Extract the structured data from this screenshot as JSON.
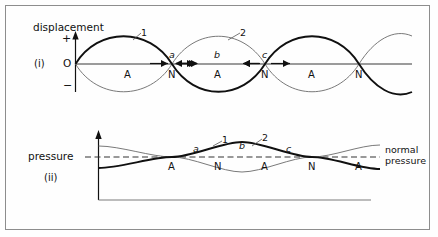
{
  "figure": {
    "title_top_axis_label": "displacement",
    "plus_sign": "+",
    "minus_sign": "−",
    "origin_label": "O",
    "panel_i_label": "(i)",
    "panel_ii_label": "(ii)",
    "pressure_axis_label": "pressure",
    "normal_pressure_label": "normal\npressure",
    "normal_pressure_line1": "normal",
    "normal_pressure_line2": "pressure",
    "curve_label_1": "1",
    "curve_label_2": "2",
    "point_a": "a",
    "point_b": "b",
    "point_c": "c",
    "node_label": "N",
    "antinode_label": "A"
  },
  "panel_i": {
    "name": "displacement-standing-wave",
    "markers": [
      {
        "label": "A",
        "x": 128
      },
      {
        "label": "N",
        "x": 172
      },
      {
        "label": "A",
        "x": 218
      },
      {
        "label": "N",
        "x": 265
      },
      {
        "label": "A",
        "x": 312
      },
      {
        "label": "N",
        "x": 359
      }
    ],
    "points": [
      {
        "label": "a",
        "x": 172,
        "arrows": "inward"
      },
      {
        "label": "b",
        "x": 218,
        "arrows": "outward"
      },
      {
        "label": "c",
        "x": 265,
        "arrows": "outward"
      }
    ],
    "curves": [
      {
        "label": "1",
        "style": "bold",
        "phase": "positive-first"
      },
      {
        "label": "2",
        "style": "thin",
        "phase": "negative-first"
      }
    ]
  },
  "panel_ii": {
    "name": "pressure-standing-wave",
    "markers": [
      {
        "label": "A",
        "x": 172
      },
      {
        "label": "N",
        "x": 218
      },
      {
        "label": "A",
        "x": 265
      },
      {
        "label": "N",
        "x": 312
      },
      {
        "label": "A",
        "x": 359
      }
    ],
    "points": [
      {
        "label": "a",
        "x": 196
      },
      {
        "label": "b",
        "x": 242
      },
      {
        "label": "c",
        "x": 289
      }
    ],
    "curves": [
      {
        "label": "1",
        "style": "bold"
      },
      {
        "label": "2",
        "style": "thin"
      }
    ]
  },
  "colors": {
    "ink": "#111111",
    "frame": "#8d8d8d",
    "axis": "#6f6f6f",
    "thin_curve": "#6a6a6a",
    "bold_curve": "#101010",
    "dashed": "#333333"
  }
}
